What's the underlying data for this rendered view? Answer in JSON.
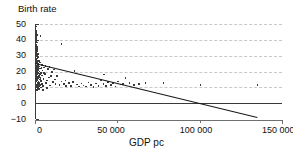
{
  "chart_data": {
    "type": "scatter",
    "title": "",
    "ylabel": "Birth rate",
    "xlabel": "GDP pc",
    "xlim": [
      0,
      150000
    ],
    "ylim": [
      -10,
      50
    ],
    "xticks": [
      0,
      50000,
      100000,
      150000
    ],
    "xticklabels": [
      "0",
      "50 000",
      "100 000",
      "150 000"
    ],
    "yticks": [
      -10,
      0,
      10,
      20,
      30,
      40,
      50
    ],
    "yticklabels": [
      "−10",
      "0",
      "10",
      "20",
      "30",
      "40",
      "50"
    ],
    "grid": "horizontal dashed gridlines at y = 10, 20, 30, 40, 50",
    "legend": "none",
    "marker_color": "#3b3b3b",
    "line_color": "#1a1a1a",
    "grid_color": "#c9c9c9",
    "axis_color": "#3a3a3a",
    "fit_line": {
      "name": "linear trend",
      "x": [
        0,
        135000
      ],
      "y": [
        25.0,
        -9.0
      ],
      "intercept": 25.0,
      "slope_per_unit": -0.000252,
      "x_intercept": 99000
    },
    "points": [
      {
        "x": 300,
        "y": 49.5
      },
      {
        "x": 500,
        "y": 48.5
      },
      {
        "x": 400,
        "y": 47.0
      },
      {
        "x": 700,
        "y": 46.0
      },
      {
        "x": 600,
        "y": 45.0
      },
      {
        "x": 900,
        "y": 44.2
      },
      {
        "x": 450,
        "y": 43.5
      },
      {
        "x": 1200,
        "y": 43.0
      },
      {
        "x": 3400,
        "y": 42.5
      },
      {
        "x": 800,
        "y": 41.8
      },
      {
        "x": 600,
        "y": 41.0
      },
      {
        "x": 1000,
        "y": 40.2
      },
      {
        "x": 700,
        "y": 39.5
      },
      {
        "x": 500,
        "y": 38.8
      },
      {
        "x": 1400,
        "y": 38.2
      },
      {
        "x": 16000,
        "y": 37.5
      },
      {
        "x": 900,
        "y": 37.0
      },
      {
        "x": 650,
        "y": 36.3
      },
      {
        "x": 1100,
        "y": 35.6
      },
      {
        "x": 800,
        "y": 35.0
      },
      {
        "x": 1600,
        "y": 34.3
      },
      {
        "x": 700,
        "y": 33.6
      },
      {
        "x": 1300,
        "y": 33.0
      },
      {
        "x": 950,
        "y": 32.3
      },
      {
        "x": 600,
        "y": 31.6
      },
      {
        "x": 1800,
        "y": 31.0
      },
      {
        "x": 1100,
        "y": 30.4
      },
      {
        "x": 800,
        "y": 29.8
      },
      {
        "x": 2200,
        "y": 29.2
      },
      {
        "x": 1400,
        "y": 28.6
      },
      {
        "x": 950,
        "y": 28.0
      },
      {
        "x": 700,
        "y": 27.4
      },
      {
        "x": 2600,
        "y": 27.0
      },
      {
        "x": 1700,
        "y": 26.5
      },
      {
        "x": 1200,
        "y": 26.0
      },
      {
        "x": 3100,
        "y": 25.6
      },
      {
        "x": 900,
        "y": 25.2
      },
      {
        "x": 2000,
        "y": 24.8
      },
      {
        "x": 1500,
        "y": 24.4
      },
      {
        "x": 4200,
        "y": 24.0
      },
      {
        "x": 1000,
        "y": 23.6
      },
      {
        "x": 2400,
        "y": 23.2
      },
      {
        "x": 1300,
        "y": 22.9
      },
      {
        "x": 5600,
        "y": 22.6
      },
      {
        "x": 1800,
        "y": 22.3
      },
      {
        "x": 3200,
        "y": 22.0
      },
      {
        "x": 1100,
        "y": 21.7
      },
      {
        "x": 7800,
        "y": 21.4
      },
      {
        "x": 2100,
        "y": 21.1
      },
      {
        "x": 1400,
        "y": 20.9
      },
      {
        "x": 4600,
        "y": 20.6
      },
      {
        "x": 900,
        "y": 20.3
      },
      {
        "x": 2800,
        "y": 20.0
      },
      {
        "x": 1600,
        "y": 19.7
      },
      {
        "x": 10200,
        "y": 19.5
      },
      {
        "x": 3600,
        "y": 19.2
      },
      {
        "x": 1200,
        "y": 19.0
      },
      {
        "x": 2300,
        "y": 18.7
      },
      {
        "x": 6200,
        "y": 18.4
      },
      {
        "x": 1500,
        "y": 18.1
      },
      {
        "x": 900,
        "y": 17.9
      },
      {
        "x": 4100,
        "y": 17.6
      },
      {
        "x": 2600,
        "y": 17.3
      },
      {
        "x": 13500,
        "y": 17.1
      },
      {
        "x": 1800,
        "y": 16.8
      },
      {
        "x": 1100,
        "y": 16.5
      },
      {
        "x": 8400,
        "y": 16.3
      },
      {
        "x": 3300,
        "y": 16.0
      },
      {
        "x": 24000,
        "y": 20.5
      },
      {
        "x": 2000,
        "y": 15.7
      },
      {
        "x": 1300,
        "y": 15.4
      },
      {
        "x": 5200,
        "y": 15.2
      },
      {
        "x": 2900,
        "y": 14.9
      },
      {
        "x": 1600,
        "y": 14.6
      },
      {
        "x": 18500,
        "y": 14.4
      },
      {
        "x": 950,
        "y": 14.1
      },
      {
        "x": 3800,
        "y": 13.9
      },
      {
        "x": 2200,
        "y": 13.6
      },
      {
        "x": 11000,
        "y": 13.4
      },
      {
        "x": 1400,
        "y": 13.1
      },
      {
        "x": 6800,
        "y": 12.9
      },
      {
        "x": 2600,
        "y": 12.6
      },
      {
        "x": 1700,
        "y": 12.4
      },
      {
        "x": 4400,
        "y": 12.1
      },
      {
        "x": 1000,
        "y": 11.9
      },
      {
        "x": 3100,
        "y": 11.6
      },
      {
        "x": 2000,
        "y": 11.4
      },
      {
        "x": 9200,
        "y": 11.2
      },
      {
        "x": 1300,
        "y": 10.9
      },
      {
        "x": 5000,
        "y": 10.7
      },
      {
        "x": 2400,
        "y": 10.5
      },
      {
        "x": 1600,
        "y": 10.2
      },
      {
        "x": 3600,
        "y": 10.0
      },
      {
        "x": 1100,
        "y": 9.8
      },
      {
        "x": 7400,
        "y": 9.6
      },
      {
        "x": 2100,
        "y": 9.4
      },
      {
        "x": 1500,
        "y": 9.1
      },
      {
        "x": 2800,
        "y": 8.9
      },
      {
        "x": 1900,
        "y": 8.6
      },
      {
        "x": 4800,
        "y": 8.4
      },
      {
        "x": 1200,
        "y": 8.2
      },
      {
        "x": 12500,
        "y": 12.0
      },
      {
        "x": 14800,
        "y": 11.5
      },
      {
        "x": 16200,
        "y": 13.8
      },
      {
        "x": 17500,
        "y": 12.2
      },
      {
        "x": 19000,
        "y": 10.8
      },
      {
        "x": 20500,
        "y": 12.8
      },
      {
        "x": 21800,
        "y": 11.0
      },
      {
        "x": 23000,
        "y": 13.2
      },
      {
        "x": 25500,
        "y": 11.8
      },
      {
        "x": 26800,
        "y": 10.4
      },
      {
        "x": 28200,
        "y": 12.5
      },
      {
        "x": 29500,
        "y": 11.2
      },
      {
        "x": 31000,
        "y": 10.6
      },
      {
        "x": 32500,
        "y": 13.0
      },
      {
        "x": 34000,
        "y": 11.6
      },
      {
        "x": 35500,
        "y": 10.2
      },
      {
        "x": 37000,
        "y": 12.4
      },
      {
        "x": 38500,
        "y": 11.0
      },
      {
        "x": 40000,
        "y": 14.6
      },
      {
        "x": 41500,
        "y": 12.0
      },
      {
        "x": 43000,
        "y": 10.8
      },
      {
        "x": 44500,
        "y": 13.4
      },
      {
        "x": 46000,
        "y": 11.4
      },
      {
        "x": 47500,
        "y": 12.6
      },
      {
        "x": 42000,
        "y": 18.0
      },
      {
        "x": 49000,
        "y": 10.6
      },
      {
        "x": 50500,
        "y": 13.8
      },
      {
        "x": 52000,
        "y": 11.8
      },
      {
        "x": 53500,
        "y": 12.2
      },
      {
        "x": 55000,
        "y": 15.8
      },
      {
        "x": 57500,
        "y": 12.8
      },
      {
        "x": 60000,
        "y": 11.5
      },
      {
        "x": 63000,
        "y": 12.2
      },
      {
        "x": 67000,
        "y": 12.6
      },
      {
        "x": 78000,
        "y": 12.8
      },
      {
        "x": 100500,
        "y": 11.6
      },
      {
        "x": 135000,
        "y": 11.4
      },
      {
        "x": 8800,
        "y": 22.8
      },
      {
        "x": 11500,
        "y": 21.2
      },
      {
        "x": 6500,
        "y": 23.5
      },
      {
        "x": 5400,
        "y": 19.0
      },
      {
        "x": 9600,
        "y": 17.2
      },
      {
        "x": 7200,
        "y": 14.2
      },
      {
        "x": 4000,
        "y": 22.2
      },
      {
        "x": 3000,
        "y": 18.3
      },
      {
        "x": 12000,
        "y": 15.0
      },
      {
        "x": 2500,
        "y": 16.2
      },
      {
        "x": 1750,
        "y": 23.8
      },
      {
        "x": 2300,
        "y": 26.8
      }
    ]
  }
}
